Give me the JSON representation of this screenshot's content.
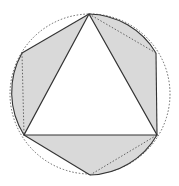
{
  "diagram": {
    "colors": {
      "background": "#ffffff",
      "shade": "#d9d9d9",
      "stroke": "#333333",
      "dotted": "#555555"
    },
    "circle": {
      "cx": 90,
      "cy": 94,
      "r": 80
    },
    "triangle_vertices": [
      [
        89,
        14
      ],
      [
        24,
        135
      ],
      [
        157,
        135
      ]
    ],
    "hexagon_vertices": [
      [
        89,
        14
      ],
      [
        156,
        53
      ],
      [
        157,
        135
      ],
      [
        90,
        175
      ],
      [
        24,
        135
      ],
      [
        22,
        53
      ]
    ]
  }
}
